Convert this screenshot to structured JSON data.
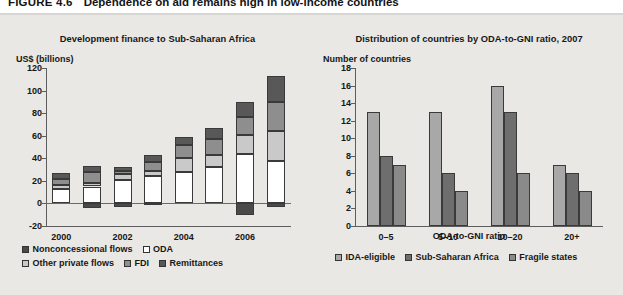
{
  "figure": {
    "number": "FIGURE 4.6",
    "caption": "Dependence on aid remains high in low-income countries"
  },
  "colors": {
    "nonconcessional_flows": "#4a4a4a",
    "oda": "#ffffff",
    "other_private_flows": "#c9c9c9",
    "fdi": "#8e8e8e",
    "remittances": "#585858",
    "ida_eligible": "#a8a8a8",
    "sub_saharan_africa": "#6e6e6e",
    "fragile_states": "#8a8a8a",
    "page_background": "#e9e8e4",
    "axis": "#5d5d5d"
  },
  "chart_data": [
    {
      "type": "bar",
      "id": "development-finance",
      "title": "Development finance to Sub-Saharan Africa",
      "ylabel": "US$ (billions)",
      "xlabel": "",
      "ylim": [
        -20,
        120
      ],
      "yticks": [
        -20,
        0,
        20,
        40,
        60,
        80,
        100,
        120
      ],
      "grid": false,
      "stacked": true,
      "legend_position": "bottom",
      "categories": [
        "2000",
        "2001",
        "2002",
        "2003",
        "2004",
        "2005",
        "2006",
        "2007"
      ],
      "xtick_labels": [
        "2000",
        "",
        "2002",
        "",
        "2004",
        "",
        "2006",
        ""
      ],
      "series": [
        {
          "name": "ODA",
          "values": [
            13,
            15,
            21,
            24,
            28,
            32,
            44,
            38
          ]
        },
        {
          "name": "Other private flows",
          "values": [
            3,
            3,
            5,
            5,
            12,
            11,
            17,
            26
          ]
        },
        {
          "name": "FDI",
          "values": [
            6,
            10,
            3,
            8,
            12,
            14,
            16,
            26
          ]
        },
        {
          "name": "Remittances",
          "values": [
            5,
            5,
            3,
            6,
            7,
            10,
            13,
            23
          ]
        },
        {
          "name": "Nonconcessional flows",
          "values": [
            0,
            -4,
            -3,
            -1,
            0,
            0,
            -10,
            -3
          ]
        }
      ]
    },
    {
      "type": "bar",
      "id": "oda-to-gni-distribution",
      "title": "Distribution of countries by ODA-to-GNI ratio, 2007",
      "ylabel": "Number of countries",
      "xlabel": "ODA-to-GNI ratio",
      "ylim": [
        0,
        18
      ],
      "yticks": [
        0,
        2,
        4,
        6,
        8,
        10,
        12,
        14,
        16,
        18
      ],
      "grid": false,
      "stacked": false,
      "legend_position": "bottom",
      "categories": [
        "0–5",
        "5–10",
        "10–20",
        "20+"
      ],
      "series": [
        {
          "name": "IDA-eligible",
          "values": [
            13,
            13,
            16,
            7
          ]
        },
        {
          "name": "Sub-Saharan Africa",
          "values": [
            8,
            6,
            13,
            6
          ]
        },
        {
          "name": "Fragile states",
          "values": [
            7,
            4,
            6,
            4
          ]
        }
      ]
    }
  ],
  "left_legend": {
    "row1": [
      {
        "label": "Nonconcessional flows",
        "color_key": "nonconcessional_flows"
      },
      {
        "label": "ODA",
        "color_key": "oda"
      }
    ],
    "row2": [
      {
        "label": "Other private flows",
        "color_key": "other_private_flows"
      },
      {
        "label": "FDI",
        "color_key": "fdi"
      },
      {
        "label": "Remittances",
        "color_key": "remittances"
      }
    ]
  },
  "right_legend": {
    "row1": [
      {
        "label": "IDA-eligible",
        "color_key": "ida_eligible"
      },
      {
        "label": "Sub-Saharan Africa",
        "color_key": "sub_saharan_africa"
      },
      {
        "label": "Fragile states",
        "color_key": "fragile_states"
      }
    ]
  }
}
